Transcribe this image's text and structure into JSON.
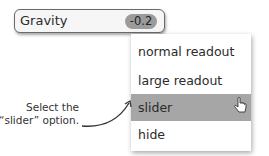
{
  "field": {
    "label": "Gravity",
    "value": "-0.2"
  },
  "menu": {
    "items": [
      {
        "label": "normal readout",
        "selected": false
      },
      {
        "label": "large readout",
        "selected": false
      },
      {
        "label": "slider",
        "selected": true
      },
      {
        "label": "hide",
        "selected": false
      }
    ]
  },
  "annotation": {
    "line1": "Select the",
    "line2": "“slider” option."
  },
  "colors": {
    "selected_bg": "#a6a6a6",
    "badge_bg": "#9b9b9b"
  }
}
